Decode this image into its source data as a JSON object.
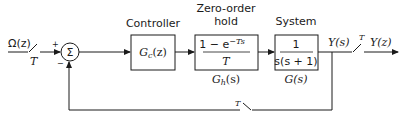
{
  "diagram": {
    "type": "block-diagram",
    "input": {
      "label": "Ω(z)",
      "sampler_label": "T"
    },
    "summing_junction": {
      "symbol": "Σ",
      "plus_sign": "+",
      "minus_sign": "−"
    },
    "blocks": [
      {
        "id": "controller",
        "title": "Controller",
        "content": "G c(z)",
        "content_main": "G",
        "content_sub": "c",
        "content_arg": "(z)"
      },
      {
        "id": "zoh",
        "title_line1": "Zero-order",
        "title_line2": "hold",
        "numerator": "1 − e",
        "exponent": "−Ts",
        "denominator": "T",
        "caption_main": "G",
        "caption_sub": "h",
        "caption_arg": "(s)"
      },
      {
        "id": "system",
        "title": "System",
        "numerator": "1",
        "denominator": "s(s + 1)",
        "caption": "G(s)"
      }
    ],
    "output": {
      "continuous_label": "Y(s)",
      "sampler_label": "T",
      "discrete_label": "Y(z)"
    },
    "feedback": {
      "sampler_label": "T"
    },
    "colors": {
      "line": "#1a1a1a",
      "background": "#ffffff"
    }
  }
}
